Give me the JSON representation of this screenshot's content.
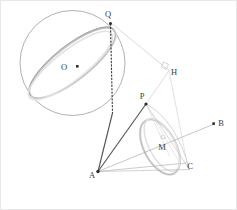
{
  "figure": {
    "width": 237,
    "height": 210,
    "background_color": "#ffffff",
    "border_color": "#e4e4e4"
  },
  "colors": {
    "sphere_outline": "#8a8a8a",
    "great_circle_light": "#d8d8d8",
    "great_circle_mid": "#a8a8a8",
    "cone_light": "#d5d5d5",
    "cone_mid": "#9b9b9b",
    "solid_dark": "#4a4a4a",
    "dotted_dark": "#3a3a3a",
    "thin_gray": "#b0b0b0",
    "label_text": "#3c3c3c",
    "faint_text": "#bcbcbc",
    "point_fill": "#2b2b2b"
  },
  "points": [
    {
      "id": "O",
      "label": "O",
      "x": 73.0,
      "y": 67.0,
      "label_x": 62.0,
      "label_y": 69.5,
      "marker": "square",
      "visible_marker": true
    },
    {
      "id": "Q",
      "label": "Q",
      "x": 110.5,
      "y": 22.0,
      "label_x": 107.0,
      "label_y": 18.0,
      "marker": "dot",
      "visible_marker": true
    },
    {
      "id": "H",
      "label": "H",
      "x": 168.5,
      "y": 70.0,
      "label_x": 172.5,
      "label_y": 74.0,
      "marker": "none",
      "visible_marker": false
    },
    {
      "id": "P",
      "label": "P",
      "x": 146.0,
      "y": 104.0,
      "label_x": 142.0,
      "label_y": 99.0,
      "marker": "dot",
      "visible_marker": true
    },
    {
      "id": "B",
      "label": "B",
      "x": 216.0,
      "y": 123.5,
      "label_x": 220.0,
      "label_y": 126.0,
      "marker": "dot",
      "visible_marker": true
    },
    {
      "id": "M",
      "label": "M",
      "x": 163.0,
      "y": 142.0,
      "label_x": 159.0,
      "label_y": 149.0,
      "marker": "none",
      "visible_marker": false
    },
    {
      "id": "A",
      "label": "A",
      "x": 98.0,
      "y": 171.5,
      "label_x": 92.0,
      "label_y": 178.0,
      "marker": "dot",
      "visible_marker": true
    },
    {
      "id": "C",
      "label": "C",
      "x": 186.0,
      "y": 163.0,
      "label_x": 188.5,
      "label_y": 169.0,
      "marker": "none",
      "visible_marker": false
    }
  ],
  "sphere": {
    "center_x": 72.5,
    "center_y": 63.0,
    "radius": 52.5,
    "great_circle": {
      "cx": 72.5,
      "cy": 63.0,
      "rx": 53.0,
      "ry": 17.0,
      "rotation_deg": -38
    }
  },
  "cone": {
    "apex_x": 146.0,
    "apex_y": 104.0,
    "base_ellipse": {
      "cx": 160.0,
      "cy": 147.0,
      "rx": 30.0,
      "ry": 16.0,
      "rotation_deg": 62
    }
  },
  "segments": [
    {
      "name": "Q-to-A-solid",
      "from": "Q",
      "to": "A",
      "style": "solid-dark"
    },
    {
      "name": "Q-to-H",
      "from": "Q",
      "to": "H",
      "style": "thin-gray"
    },
    {
      "name": "Q-foot-dotted",
      "from": "Q",
      "to": "foot",
      "style": "dotted"
    },
    {
      "name": "H-to-P",
      "from": "H",
      "to": "P",
      "style": "thin-gray"
    },
    {
      "name": "A-to-P",
      "from": "A",
      "to": "P",
      "style": "solid-dark"
    },
    {
      "name": "A-to-B-ray",
      "from": "A",
      "to": "B",
      "style": "thin-gray-arrow"
    },
    {
      "name": "A-to-C",
      "from": "A",
      "to": "C",
      "style": "thin-gray"
    },
    {
      "name": "A-to-base-bottom",
      "from": "A",
      "to": "base-bottom",
      "style": "thin-gray"
    },
    {
      "name": "P-to-base-bottom",
      "from": "P",
      "to": "base-bottom",
      "style": "thin-gray"
    }
  ],
  "markers": {
    "right_angle_at_H": {
      "x": 163.0,
      "y": 64.0,
      "size": 5.5,
      "rotation_deg": 28
    }
  },
  "faint_labels": [
    {
      "text": "G",
      "x": 163.0,
      "y": 137.0
    }
  ]
}
